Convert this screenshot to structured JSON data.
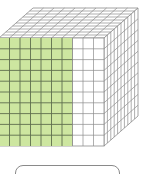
{
  "diagram": {
    "type": "unit-cube-fraction",
    "cube": {
      "columns": 10,
      "rows": 10,
      "depth": 10,
      "shaded_columns_front": 7,
      "shade_color": "#cde6a0",
      "grid_line_color": "#5f6e4e",
      "unshaded_line_color": "#8c8c8c",
      "fill_unshaded": "#ffffff"
    },
    "answer_box": {
      "value": "",
      "border_color": "#8a8a8a"
    }
  }
}
